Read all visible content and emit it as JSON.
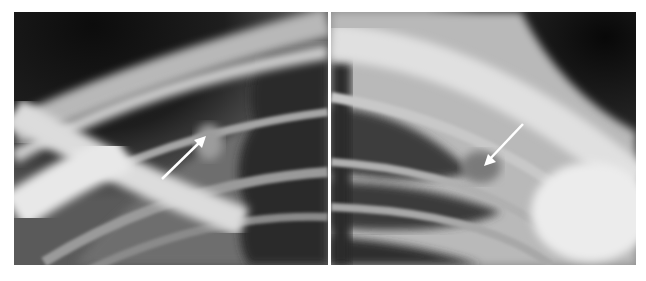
{
  "figure": {
    "panels": [
      {
        "id": "left",
        "description": "Chest radiograph, apical view (left side of patient), arrow pointing up-right at a rounded opacity near a rib",
        "arrow": {
          "direction": "up-right",
          "color": "#ffffff"
        }
      },
      {
        "id": "right",
        "description": "Chest radiograph, apical view (right side), arrow pointing down-left at an opacity near a rib",
        "arrow": {
          "direction": "down-left",
          "color": "#ffffff"
        }
      }
    ],
    "background": "#ffffff"
  }
}
